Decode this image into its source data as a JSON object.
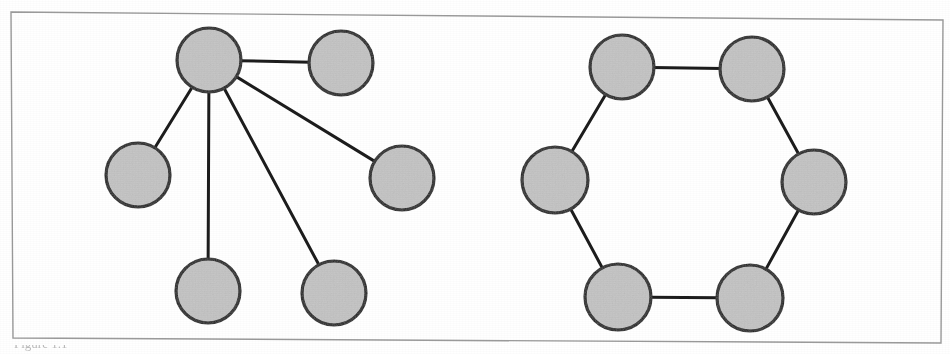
{
  "figure": {
    "frame": {
      "stroke": "#9a9a9a",
      "stroke_width": 1.4,
      "points": "11,12 943,20 941,343 13,338"
    },
    "style": {
      "node_fill": "#c4c4c4",
      "node_stroke": "#1c1c1c",
      "node_stroke_width": 3.2,
      "edge_stroke": "#1c1c1c",
      "edge_stroke_width": 3.0,
      "background": "#ffffff"
    },
    "caption_fragment": "Figure 1.1",
    "panels": [
      {
        "id": "left-graph",
        "name": "star-graph",
        "type": "star",
        "node_count": 6,
        "edge_count": 5,
        "nodes": [
          {
            "id": "hub",
            "label": "",
            "cx": 209,
            "cy": 60,
            "r": 32
          },
          {
            "id": "leaf-a",
            "label": "",
            "cx": 341,
            "cy": 63,
            "r": 32
          },
          {
            "id": "leaf-b",
            "label": "",
            "cx": 402,
            "cy": 178,
            "r": 32
          },
          {
            "id": "leaf-c",
            "label": "",
            "cx": 138,
            "cy": 175,
            "r": 32
          },
          {
            "id": "leaf-d",
            "label": "",
            "cx": 208,
            "cy": 291,
            "r": 32
          },
          {
            "id": "leaf-e",
            "label": "",
            "cx": 334,
            "cy": 293,
            "r": 32
          }
        ],
        "edges": [
          {
            "from": "hub",
            "to": "leaf-a"
          },
          {
            "from": "hub",
            "to": "leaf-b"
          },
          {
            "from": "hub",
            "to": "leaf-c"
          },
          {
            "from": "hub",
            "to": "leaf-d"
          },
          {
            "from": "hub",
            "to": "leaf-e"
          }
        ]
      },
      {
        "id": "right-graph",
        "name": "cycle-graph",
        "type": "cycle",
        "node_count": 6,
        "edge_count": 6,
        "nodes": [
          {
            "id": "n1",
            "label": "",
            "cx": 622,
            "cy": 67,
            "r": 32
          },
          {
            "id": "n2",
            "label": "",
            "cx": 752,
            "cy": 69,
            "r": 32
          },
          {
            "id": "n3",
            "label": "",
            "cx": 814,
            "cy": 182,
            "r": 32
          },
          {
            "id": "n4",
            "label": "",
            "cx": 750,
            "cy": 298,
            "r": 33
          },
          {
            "id": "n5",
            "label": "",
            "cx": 618,
            "cy": 297,
            "r": 33
          },
          {
            "id": "n6",
            "label": "",
            "cx": 555,
            "cy": 180,
            "r": 33
          }
        ],
        "edges": [
          {
            "from": "n1",
            "to": "n2"
          },
          {
            "from": "n2",
            "to": "n3"
          },
          {
            "from": "n3",
            "to": "n4"
          },
          {
            "from": "n4",
            "to": "n5"
          },
          {
            "from": "n5",
            "to": "n6"
          },
          {
            "from": "n6",
            "to": "n1"
          }
        ]
      }
    ]
  }
}
